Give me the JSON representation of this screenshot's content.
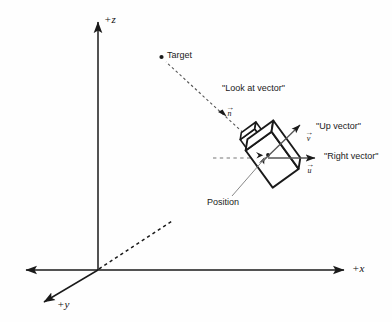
{
  "figure": {
    "type": "diagram",
    "background_color": "#fefefe",
    "line_color": "#1a1a1a"
  },
  "axes": {
    "origin": {
      "x": 98,
      "y": 270
    },
    "items": [
      {
        "id": "z",
        "label": "+z",
        "direction": "up",
        "tip": {
          "x": 98,
          "y": 18
        }
      },
      {
        "id": "x",
        "label": "+x",
        "direction": "right",
        "tip": {
          "x": 348,
          "y": 270
        }
      },
      {
        "id": "y",
        "label": "+y",
        "direction": "down-left",
        "tip": {
          "x": 40,
          "y": 305
        }
      },
      {
        "id": "x-neg",
        "label": "",
        "direction": "left",
        "tip": {
          "x": 22,
          "y": 270
        }
      }
    ],
    "dashed_axis": {
      "id": "y-negative-projection",
      "from": {
        "x": 98,
        "y": 270
      },
      "to": {
        "x": 172,
        "y": 221
      },
      "style": "dashed"
    }
  },
  "target": {
    "label": "Target",
    "dot": {
      "x": 161,
      "y": 57
    }
  },
  "look_at": {
    "label": "\"Look at vector\"",
    "vector_symbol": "n",
    "line_style": "dashed",
    "from": {
      "x": 164,
      "y": 60
    },
    "to": {
      "x": 262,
      "y": 150
    }
  },
  "camera": {
    "position_label": "Position",
    "center": {
      "x": 268,
      "y": 154
    },
    "rotation_deg": -35
  },
  "vectors": [
    {
      "id": "up-vector",
      "label": "\"Up vector\"",
      "symbol": "v",
      "from": {
        "x": 268,
        "y": 154
      },
      "to": {
        "x": 301,
        "y": 124
      }
    },
    {
      "id": "right-vector",
      "label": "\"Right vector\"",
      "symbol": "u",
      "from": {
        "x": 268,
        "y": 158
      },
      "to": {
        "x": 318,
        "y": 158
      }
    }
  ],
  "guide_line": {
    "id": "horizontal-reference",
    "style": "dashed",
    "from": {
      "x": 214,
      "y": 158
    },
    "to": {
      "x": 262,
      "y": 158
    }
  }
}
